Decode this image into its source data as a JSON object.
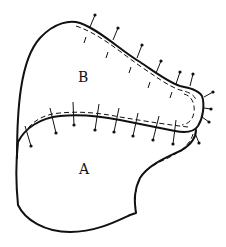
{
  "diagram": {
    "type": "sewing-pattern",
    "pieces": [
      {
        "id": "A",
        "label": "A"
      },
      {
        "id": "B",
        "label": "B"
      }
    ],
    "colors": {
      "line": "#111111",
      "background": "#ffffff"
    },
    "annotations": {
      "seam_line": "dashed stitching line",
      "pins": "pins along seam allowance"
    }
  }
}
